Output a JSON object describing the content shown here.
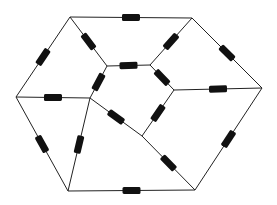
{
  "diagram": {
    "wire_color": "#222222",
    "resistor_color": "#111111",
    "nodes": {
      "A": [
        70,
        17
      ],
      "B": [
        192,
        18
      ],
      "C": [
        262,
        88
      ],
      "D": [
        195,
        190
      ],
      "E": [
        68,
        191
      ],
      "F": [
        16,
        97
      ],
      "G": [
        107,
        66
      ],
      "H": [
        150,
        65
      ],
      "I": [
        174,
        90
      ],
      "J": [
        142,
        136
      ],
      "K": [
        90,
        98
      ]
    },
    "edges": [
      {
        "from": "A",
        "to": "B",
        "resistor": true
      },
      {
        "from": "B",
        "to": "C",
        "resistor": true
      },
      {
        "from": "C",
        "to": "D",
        "resistor": true
      },
      {
        "from": "D",
        "to": "E",
        "resistor": true
      },
      {
        "from": "E",
        "to": "F",
        "resistor": true
      },
      {
        "from": "F",
        "to": "A",
        "resistor": true
      },
      {
        "from": "A",
        "to": "G",
        "resistor": true
      },
      {
        "from": "B",
        "to": "H",
        "resistor": true
      },
      {
        "from": "C",
        "to": "I",
        "resistor": true
      },
      {
        "from": "F",
        "to": "K",
        "resistor": true
      },
      {
        "from": "G",
        "to": "H",
        "resistor": true
      },
      {
        "from": "H",
        "to": "I",
        "resistor": true
      },
      {
        "from": "I",
        "to": "J",
        "resistor": true
      },
      {
        "from": "G",
        "to": "K",
        "resistor": true
      },
      {
        "from": "K",
        "to": "J",
        "resistor": true
      },
      {
        "from": "K",
        "to": "E",
        "resistor": true
      },
      {
        "from": "J",
        "to": "D",
        "resistor": true
      }
    ]
  }
}
